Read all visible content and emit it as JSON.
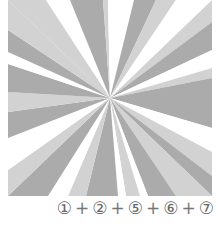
{
  "figure": {
    "center": [
      102,
      98
    ],
    "width": 204,
    "height": 196,
    "colors": {
      "white": "#ffffff",
      "light": "#d2d2d2",
      "mid": "#ababab",
      "dark": "#9a9a9a"
    },
    "rays": [
      {
        "pts": [
          [
            0,
            0
          ],
          [
            38,
            0
          ]
        ],
        "fill": "light"
      },
      {
        "pts": [
          [
            38,
            0
          ],
          [
            62,
            0
          ]
        ],
        "fill": "white"
      },
      {
        "pts": [
          [
            62,
            0
          ],
          [
            95,
            0
          ]
        ],
        "fill": "mid"
      },
      {
        "pts": [
          [
            95,
            0
          ],
          [
            100,
            0
          ]
        ],
        "fill": "light"
      },
      {
        "pts": [
          [
            100,
            0
          ],
          [
            126,
            0
          ]
        ],
        "fill": "white"
      },
      {
        "pts": [
          [
            126,
            0
          ],
          [
            148,
            0
          ]
        ],
        "fill": "mid"
      },
      {
        "pts": [
          [
            148,
            0
          ],
          [
            168,
            0
          ]
        ],
        "fill": "light"
      },
      {
        "pts": [
          [
            168,
            0
          ],
          [
            204,
            0
          ]
        ],
        "fill": "white"
      },
      {
        "pts": [
          [
            204,
            0
          ],
          [
            204,
            22
          ]
        ],
        "fill": "light"
      },
      {
        "pts": [
          [
            204,
            22
          ],
          [
            204,
            50
          ]
        ],
        "fill": "mid"
      },
      {
        "pts": [
          [
            204,
            50
          ],
          [
            204,
            68
          ]
        ],
        "fill": "white"
      },
      {
        "pts": [
          [
            204,
            68
          ],
          [
            204,
            78
          ]
        ],
        "fill": "light"
      },
      {
        "pts": [
          [
            204,
            78
          ],
          [
            204,
            128
          ]
        ],
        "fill": "mid"
      },
      {
        "pts": [
          [
            204,
            128
          ],
          [
            204,
            152
          ]
        ],
        "fill": "white"
      },
      {
        "pts": [
          [
            204,
            152
          ],
          [
            204,
            176
          ]
        ],
        "fill": "light"
      },
      {
        "pts": [
          [
            204,
            176
          ],
          [
            204,
            196
          ]
        ],
        "fill": "mid"
      },
      {
        "pts": [
          [
            204,
            196
          ],
          [
            168,
            196
          ]
        ],
        "fill": "light"
      },
      {
        "pts": [
          [
            168,
            196
          ],
          [
            140,
            196
          ]
        ],
        "fill": "mid"
      },
      {
        "pts": [
          [
            140,
            196
          ],
          [
            132,
            196
          ]
        ],
        "fill": "white"
      },
      {
        "pts": [
          [
            132,
            196
          ],
          [
            118,
            196
          ]
        ],
        "fill": "light"
      },
      {
        "pts": [
          [
            118,
            196
          ],
          [
            110,
            196
          ]
        ],
        "fill": "white"
      },
      {
        "pts": [
          [
            110,
            196
          ],
          [
            78,
            196
          ]
        ],
        "fill": "mid"
      },
      {
        "pts": [
          [
            78,
            196
          ],
          [
            60,
            196
          ]
        ],
        "fill": "light"
      },
      {
        "pts": [
          [
            60,
            196
          ],
          [
            40,
            196
          ]
        ],
        "fill": "white"
      },
      {
        "pts": [
          [
            40,
            196
          ],
          [
            0,
            196
          ]
        ],
        "fill": "mid"
      },
      {
        "pts": [
          [
            0,
            196
          ],
          [
            0,
            170
          ]
        ],
        "fill": "light"
      },
      {
        "pts": [
          [
            0,
            170
          ],
          [
            0,
            138
          ]
        ],
        "fill": "white"
      },
      {
        "pts": [
          [
            0,
            138
          ],
          [
            0,
            112
          ]
        ],
        "fill": "mid"
      },
      {
        "pts": [
          [
            0,
            112
          ],
          [
            0,
            92
          ]
        ],
        "fill": "light"
      },
      {
        "pts": [
          [
            0,
            92
          ],
          [
            0,
            64
          ]
        ],
        "fill": "mid"
      },
      {
        "pts": [
          [
            0,
            64
          ],
          [
            0,
            52
          ]
        ],
        "fill": "white"
      },
      {
        "pts": [
          [
            0,
            52
          ],
          [
            0,
            30
          ]
        ],
        "fill": "mid"
      },
      {
        "pts": [
          [
            0,
            30
          ],
          [
            0,
            0
          ]
        ],
        "fill": "light"
      }
    ]
  },
  "caption": {
    "items": [
      "①",
      "②",
      "⑤",
      "⑥",
      "⑦"
    ],
    "separator": "+"
  }
}
